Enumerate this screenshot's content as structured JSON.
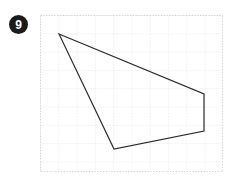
{
  "page": {
    "background_color": "#ffffff",
    "width": 240,
    "height": 188
  },
  "badge": {
    "label": "9",
    "fill_color": "#1b1b1b",
    "text_color": "#ffffff",
    "shape": "circle",
    "center_x": 18.5,
    "center_y": 24.5,
    "radius": 9.5
  },
  "grid": {
    "left": 40,
    "top": 15,
    "width": 183,
    "height": 157,
    "cell_size": 18.3,
    "columns": 10,
    "rows": 8.6,
    "line_color": "#d8d8dd",
    "line_style": "dotted",
    "line_width": 1,
    "border_color": "#d0d0d6",
    "visible": true
  },
  "figure": {
    "name": "quadrilateral",
    "type": "polygon",
    "vertex_count": 4,
    "stroke_color": "#2b2b2b",
    "stroke_width": 1.2,
    "fill": "none",
    "vertices": [
      {
        "label": "A",
        "x": 59,
        "y": 34
      },
      {
        "label": "B",
        "x": 204,
        "y": 94
      },
      {
        "label": "C",
        "x": 204,
        "y": 131
      },
      {
        "label": "D",
        "x": 114,
        "y": 149
      }
    ],
    "vertices_grid_relative": [
      {
        "label": "A",
        "x": 19,
        "y": 19
      },
      {
        "label": "B",
        "x": 164,
        "y": 79
      },
      {
        "label": "C",
        "x": 164,
        "y": 116
      },
      {
        "label": "D",
        "x": 74,
        "y": 134
      }
    ],
    "points_attr": "19,19 164,79 164,116 74,134",
    "edges": [
      {
        "from": "A",
        "to": "B"
      },
      {
        "from": "B",
        "to": "C"
      },
      {
        "from": "C",
        "to": "D"
      },
      {
        "from": "D",
        "to": "A"
      }
    ]
  }
}
